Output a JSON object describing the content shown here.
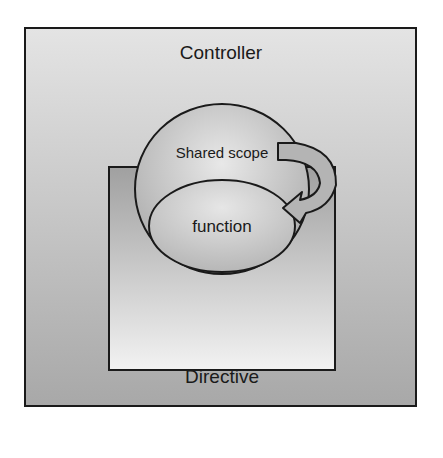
{
  "diagram": {
    "controller": {
      "label": "Controller"
    },
    "directive": {
      "label": "Directive"
    },
    "shared_scope": {
      "label": "Shared scope"
    },
    "function": {
      "label": "function"
    }
  },
  "colors": {
    "stroke": "#1a1a1a",
    "outer_top": "#e2e2e2",
    "outer_bottom": "#a9a9a9",
    "directive_top": "#a8a8a8",
    "directive_bottom": "#f0f0f0",
    "arrow": "#b0b0b0"
  }
}
